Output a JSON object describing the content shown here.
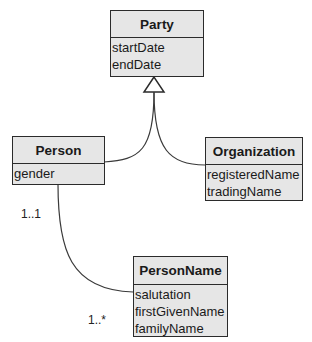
{
  "classes": {
    "party": {
      "name": "Party",
      "attributes": [
        "startDate",
        "endDate"
      ]
    },
    "person": {
      "name": "Person",
      "attributes": [
        "gender"
      ]
    },
    "organization": {
      "name": "Organization",
      "attributes": [
        "registeredName",
        "tradingName"
      ]
    },
    "personName": {
      "name": "PersonName",
      "attributes": [
        "salutation",
        "firstGivenName",
        "familyName"
      ]
    }
  },
  "relationships": {
    "generalization": {
      "parent": "Party",
      "children": [
        "Person",
        "Organization"
      ]
    },
    "association": {
      "from": "Person",
      "to": "PersonName",
      "fromMultiplicity": "1..1",
      "toMultiplicity": "1..*"
    }
  }
}
